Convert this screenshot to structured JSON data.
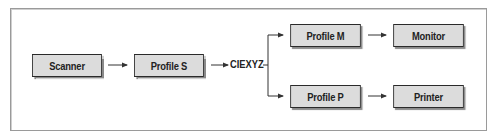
{
  "diagram": {
    "nodes": {
      "scanner": "Scanner",
      "profile_s": "Profile S",
      "ciexyz": "CIEXYZ",
      "profile_m": "Profile M",
      "monitor": "Monitor",
      "profile_p": "Profile P",
      "printer": "Printer"
    },
    "edges": [
      {
        "from": "Scanner",
        "to": "Profile S"
      },
      {
        "from": "Profile S",
        "to": "CIEXYZ"
      },
      {
        "from": "CIEXYZ",
        "to": "Profile M"
      },
      {
        "from": "CIEXYZ",
        "to": "Profile P"
      },
      {
        "from": "Profile M",
        "to": "Monitor"
      },
      {
        "from": "Profile P",
        "to": "Printer"
      }
    ],
    "colors": {
      "box_fill": "#dcdcdc",
      "box_border": "#2a2a2a",
      "line": "#333333",
      "frame": "#9a9a9a"
    }
  }
}
